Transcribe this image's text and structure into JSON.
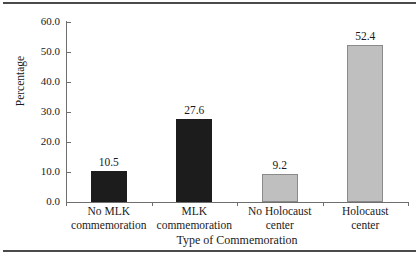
{
  "figure": {
    "background": "#ffffff",
    "rule_color": "#4a4a4a",
    "axis_color": "#6e6e6e"
  },
  "chart_data": {
    "type": "bar",
    "title": "",
    "xlabel": "Type of Commemoration",
    "ylabel": "Percentage",
    "categories": [
      "No MLK commemoration",
      "MLK commemoration",
      "No Holocaust center",
      "Holocaust center"
    ],
    "category_lines": [
      [
        "No MLK",
        "commemoration"
      ],
      [
        "MLK",
        "commemoration"
      ],
      [
        "No Holocaust",
        "center"
      ],
      [
        "Holocaust",
        "center"
      ]
    ],
    "values": [
      10.5,
      27.6,
      9.2,
      52.4
    ],
    "value_labels": [
      "10.5",
      "27.6",
      "9.2",
      "52.4"
    ],
    "bar_colors": [
      "#1c1c1c",
      "#1c1c1c",
      "#bfbfbf",
      "#bfbfbf"
    ],
    "bar_styles": [
      "dark",
      "dark",
      "light",
      "light"
    ],
    "ylim": [
      0.0,
      60.0
    ],
    "yticks": [
      0.0,
      10.0,
      20.0,
      30.0,
      40.0,
      50.0,
      60.0
    ],
    "ytick_labels": [
      "0.0",
      "10.0",
      "20.0",
      "30.0",
      "40.0",
      "50.0",
      "60.0"
    ],
    "grid": false,
    "legend": null
  }
}
